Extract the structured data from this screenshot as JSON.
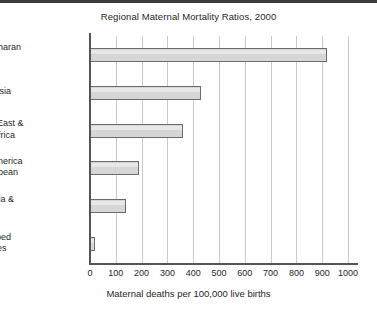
{
  "chart_data": {
    "type": "bar",
    "orientation": "horizontal",
    "title": "Regional Maternal Mortality Ratios, 2000",
    "xlabel": "Maternal deaths per 100,000 live births",
    "ylabel": "",
    "categories": [
      "Sub-Saharan Africa",
      "South Asia",
      "Middle East & North Africa",
      "Latin America & Caribbean",
      "East Asia & Pacific",
      "Developed Countries"
    ],
    "category_lines": [
      [
        "Sub-Saharan",
        "Africa"
      ],
      [
        "South Asia"
      ],
      [
        "Middle East &",
        "North Africa"
      ],
      [
        "Latin America",
        "& Caribbean"
      ],
      [
        "East Asia &",
        "Pacific"
      ],
      [
        "Developed",
        "Countries"
      ]
    ],
    "values": [
      920,
      430,
      360,
      190,
      140,
      20
    ],
    "xlim": [
      0,
      1000
    ],
    "xticks": [
      0,
      100,
      200,
      300,
      400,
      500,
      600,
      700,
      800,
      900,
      1000
    ],
    "xtick_labels": [
      "0",
      "100",
      "200",
      "300",
      "400",
      "500",
      "600",
      "700",
      "800",
      "900",
      "1000"
    ],
    "grid": "vertical",
    "legend": "none",
    "bar_fill_color": "#d6d6d6",
    "bar_edge_color": "#6b6b6b",
    "gridline_color": "#c9c9c9",
    "axis_color": "#555555",
    "background_color": "#ffffff"
  }
}
